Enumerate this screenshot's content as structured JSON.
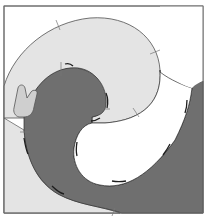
{
  "diagram": {
    "type": "pattern-block",
    "colors": {
      "background": "#ffffff",
      "frame": "#6e6e6e",
      "light_piece": "#e4e4e4",
      "dark_piece": "#6f6f6f",
      "white_piece": "#ffffff",
      "outline": "#3a3a3a",
      "clip": "#cfcfcf"
    },
    "pieces": [
      {
        "name": "light-swirl",
        "fill": "light"
      },
      {
        "name": "dark-wave",
        "fill": "dark"
      },
      {
        "name": "white-center",
        "fill": "white"
      },
      {
        "name": "clip-tab",
        "fill": "clip"
      }
    ]
  }
}
